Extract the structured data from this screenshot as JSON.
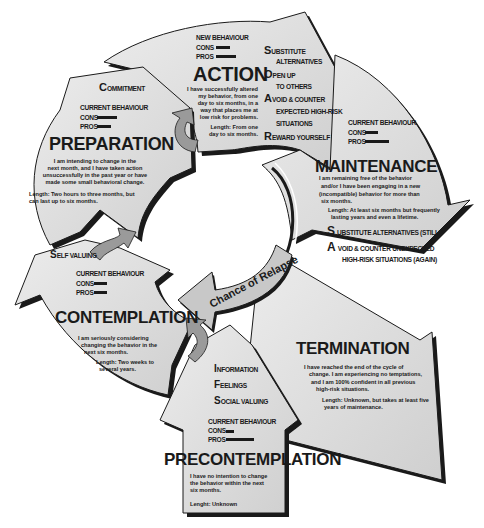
{
  "diagram": {
    "center_label": "Chance of Relapse",
    "stages": {
      "action": {
        "title": "ACTION",
        "behaviour_heading": "NEW BEHAVIOUR",
        "cons_label": "CONS",
        "pros_label": "PROS",
        "description": [
          "I have successfully altered",
          "my behavior, from one",
          "day to six months, in a",
          "way that places me at",
          "low risk for problems."
        ],
        "length": [
          "Length: From one",
          "day to six months."
        ],
        "strategies": [
          {
            "initial": "S",
            "rest": "UBSTITUTE",
            "cont": "ALTERNATIVES"
          },
          {
            "initial": "O",
            "rest": "PEN UP",
            "cont": "TO OTHERS"
          },
          {
            "initial": "A",
            "rest": "VOID & COUNTER",
            "cont": "EXPECTED HIGH-RISK",
            "cont2": "SITUATIONS"
          },
          {
            "initial": "R",
            "rest": "EWARD YOURSELF"
          }
        ]
      },
      "preparation": {
        "title": "PREPARATION",
        "strategy": {
          "initial": "C",
          "rest": "OMMITMENT"
        },
        "behaviour_heading": "CURRENT BEHAVIOUR",
        "cons_label": "CONS",
        "pros_label": "PROS",
        "description": [
          "I am intending to change in the",
          "next month, and I have taken action",
          "unsuccessfully in the past year or have",
          "made some small behavioral change."
        ],
        "length": [
          "Length: Two hours to three months, but",
          "can last up to six months."
        ]
      },
      "maintenance": {
        "title": "MAINTENANCE",
        "behaviour_heading": "CURRENT BEHAVIOUR",
        "cons_label": "CONS",
        "pros_label": "PROS",
        "description": [
          "I am remaining free of the behavior",
          "and/or I have been engaging in a new",
          "(incompatible) behavior for more than",
          "six months."
        ],
        "length": [
          "Length: At least six months but frequently",
          "lasting years and even a lifetime."
        ],
        "strategies": [
          {
            "initial": "S",
            "rest": "UBSTITUTE ALTERNATIVES  (STILL)"
          },
          {
            "initial": "A",
            "rest": "VOID & COUNTER UNEXPECTED",
            "cont": "HIGH-RISK SITUATIONS (AGAIN)"
          }
        ]
      },
      "contemplation": {
        "title": "CONTEMPLATION",
        "strategy": {
          "initial": "S",
          "rest": "ELF VALUING"
        },
        "behaviour_heading": "CURRENT BEHAVIOUR",
        "cons_label": "CONS",
        "pros_label": "PROS",
        "description": [
          "I am seriously considering",
          "changing the behavior in the",
          "next six months."
        ],
        "length": [
          "Length: Two weeks to",
          "several years."
        ]
      },
      "termination": {
        "title": "TERMINATION",
        "description": [
          "I have reached the end of the cycle of",
          "change. I am experiencing no temptations,",
          "and I am 100% confident in all previous",
          "high-risk situations."
        ],
        "length": [
          "Length: Unknown, but takes at least five",
          "years of maintenance."
        ]
      },
      "precontemplation": {
        "title": "PRECONTEMPLATION",
        "strategies": [
          {
            "initial": "I",
            "rest": "NFORMATION"
          },
          {
            "initial": "F",
            "rest": "EELINGS"
          },
          {
            "initial": "S",
            "rest": "OCIAL VALUING"
          }
        ],
        "behaviour_heading": "CURRENT BEHAVIOUR",
        "cons_label": "CONS",
        "pros_label": "PROS",
        "description": [
          "I have no intention to change",
          "the behavior within the next",
          "six months."
        ],
        "length": [
          "Lenght: Unknown"
        ]
      }
    },
    "colors": {
      "fill": "#d9d9d9",
      "fill_light": "#e6e6e6",
      "outline": "#1a1a1a",
      "connector": "#9a9a9a"
    }
  }
}
